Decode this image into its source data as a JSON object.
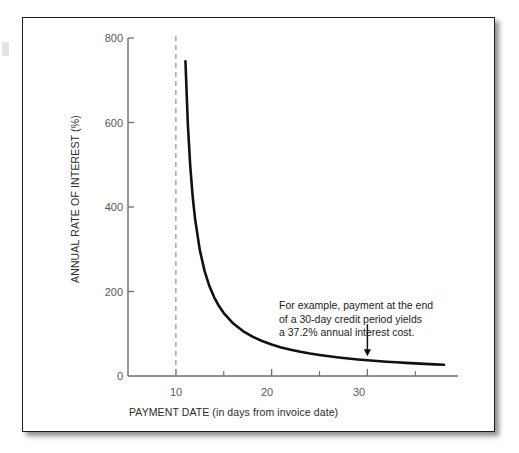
{
  "figure": {
    "background_color": "#ffffff",
    "frame_color": "#1c1c1c",
    "curve_color": "#111111",
    "axis_color": "#6e6e70",
    "tick_label_color": "#58585a",
    "marker_line_color": "#9a9a9c"
  },
  "chart_data": {
    "type": "line",
    "title": "",
    "subtitle": "",
    "xlabel": "PAYMENT DATE (in days from invoice date)",
    "ylabel": "ANNUAL RATE OF INTEREST (%)",
    "xlim": [
      5,
      38
    ],
    "ylim": [
      0,
      800
    ],
    "grid": false,
    "legend": null,
    "x_ticks": [
      10,
      20,
      30
    ],
    "x_tick_labels": [
      "10",
      "20",
      "30"
    ],
    "x_minor_ticks": [
      15,
      25,
      35
    ],
    "y_ticks": [
      0,
      200,
      400,
      600,
      800
    ],
    "y_tick_labels": [
      "0",
      "200",
      "400",
      "600",
      "800"
    ],
    "series": [
      {
        "name": "Annual rate of interest",
        "x": [
          11.0,
          11.25,
          11.5,
          11.75,
          12.0,
          12.5,
          13.0,
          13.5,
          14.0,
          14.5,
          15.0,
          16.0,
          17.0,
          18.0,
          19.0,
          20.0,
          21.0,
          22.0,
          23.0,
          24.0,
          25.0,
          26.0,
          27.0,
          28.0,
          29.0,
          30.0,
          31.0,
          32.0,
          33.0,
          34.0,
          35.0,
          36.0,
          37.0,
          38.0
        ],
        "y": [
          745.0,
          596.0,
          497.0,
          426.0,
          372.5,
          298.0,
          248.3,
          212.9,
          186.3,
          165.6,
          149.0,
          124.2,
          106.4,
          93.1,
          82.8,
          74.5,
          67.7,
          62.1,
          57.3,
          53.2,
          49.7,
          46.6,
          43.8,
          41.4,
          39.2,
          37.2,
          35.5,
          33.9,
          32.4,
          31.0,
          29.8,
          28.7,
          27.6,
          26.6
        ]
      }
    ],
    "marker_line": {
      "type": "vertical-dashed",
      "x": 10,
      "label": ""
    },
    "annotations": [
      {
        "kind": "text-with-arrow",
        "lines": [
          "For example, payment at the end",
          "of a 30-day credit period yields",
          "a 37.2% annual interest cost."
        ],
        "arrow_points_to_x": 30,
        "arrow_points_to_y": 37.2
      }
    ]
  }
}
